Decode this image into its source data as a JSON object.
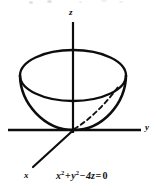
{
  "figure": {
    "caption_equation": "x² + y² − 4z = 0",
    "surface_name": "elliptic-paraboloid",
    "axis_labels": {
      "x": "x",
      "y": "y",
      "z": "z"
    },
    "equation_parts": {
      "term1_base": "x",
      "term1_exp": "2",
      "plus": "+",
      "term2_base": "y",
      "term2_exp": "2",
      "minus": "−",
      "term3": "4z",
      "equals": "=",
      "rhs": "0"
    },
    "colors": {
      "ink": "#0d0d0d",
      "background": "#ffffff",
      "dashed_line": "#111111"
    },
    "geometry": {
      "origin": {
        "x": 73,
        "y": 130
      },
      "z_axis": {
        "x": 73,
        "y_top": 22,
        "y_bottom": 133
      },
      "y_axis": {
        "y": 130,
        "x_left": 8,
        "x_right": 141
      },
      "x_axis": {
        "x1": 73,
        "y1": 130,
        "x2": 33,
        "y2": 167
      },
      "rim_ellipse": {
        "cx": 73,
        "cy": 75.5,
        "rx": 53,
        "ry": 25.5
      },
      "bowl_depth_y": 130,
      "generatrix_dashed": {
        "x1": 74,
        "y1": 129,
        "x2": 118,
        "y2": 87
      }
    }
  }
}
